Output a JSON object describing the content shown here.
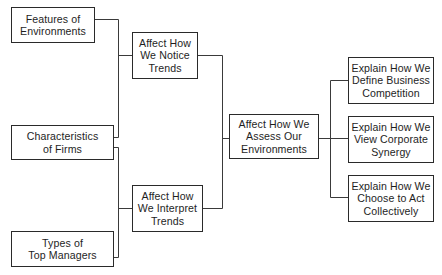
{
  "diagram": {
    "line_color": "#3a3a3a",
    "nodes": {
      "features": {
        "label": "Features of\nEnvironments"
      },
      "characteristics": {
        "label": "Characteristics\nof Firms"
      },
      "types": {
        "label": "Types of\nTop Managers"
      },
      "notice": {
        "label": "Affect How\nWe Notice\nTrends"
      },
      "interpret": {
        "label": "Affect How\nWe Interpret\nTrends"
      },
      "assess": {
        "label": "Affect How We\nAssess Our\nEnvironments"
      },
      "define": {
        "label": "Explain How We\nDefine Business\nCompetition"
      },
      "synergy": {
        "label": "Explain How We\nView Corporate\nSynergy"
      },
      "collective": {
        "label": "Explain How We\nChoose to Act\nCollectively"
      }
    },
    "edges": [
      {
        "from": "features",
        "to": "notice"
      },
      {
        "from": "characteristics",
        "to": "notice"
      },
      {
        "from": "characteristics",
        "to": "interpret"
      },
      {
        "from": "types",
        "to": "interpret"
      },
      {
        "from": "notice",
        "to": "assess"
      },
      {
        "from": "interpret",
        "to": "assess"
      },
      {
        "from": "assess",
        "to": "define"
      },
      {
        "from": "assess",
        "to": "synergy"
      },
      {
        "from": "assess",
        "to": "collective"
      }
    ]
  }
}
